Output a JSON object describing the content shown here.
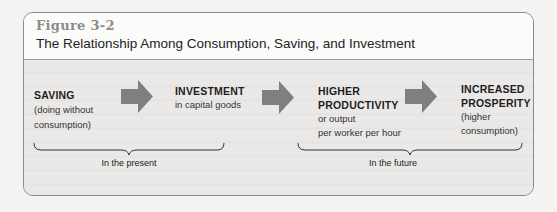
{
  "figure": {
    "number": "Figure 3-2",
    "title": "The Relationship Among Consumption, Saving, and Investment"
  },
  "steps": [
    {
      "heading": [
        "SAVING"
      ],
      "sub": [
        "(doing without",
        "consumption)"
      ]
    },
    {
      "heading": [
        "INVESTMENT"
      ],
      "sub": [
        "in capital goods"
      ]
    },
    {
      "heading": [
        "HIGHER",
        "PRODUCTIVITY"
      ],
      "sub": [
        "or output",
        "per worker per hour"
      ]
    },
    {
      "heading": [
        "INCREASED",
        "PROSPERITY"
      ],
      "sub": [
        "(higher",
        "consumption)"
      ]
    }
  ],
  "arrows": [
    "right-arrow-icon",
    "right-arrow-icon",
    "right-arrow-icon"
  ],
  "groups": [
    {
      "label": "In the present"
    },
    {
      "label": "In the future"
    }
  ],
  "colors": {
    "arrow": "#7f7f7f",
    "figure_number": "#8c8c8c",
    "body_bg": "#eae9e7",
    "header_bg": "#fbfbfa"
  }
}
